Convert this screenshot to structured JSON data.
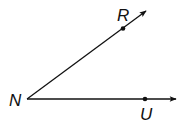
{
  "diagram": {
    "type": "angle",
    "vertex": {
      "label": "N",
      "x": 27,
      "y": 99
    },
    "rays": [
      {
        "name": "ray-NR",
        "from": "N",
        "through": "R",
        "tip": {
          "x": 147,
          "y": 10
        }
      },
      {
        "name": "ray-NU",
        "from": "N",
        "through": "U",
        "tip": {
          "x": 177,
          "y": 99
        }
      }
    ],
    "points": [
      {
        "label": "R",
        "x": 123,
        "y": 28
      },
      {
        "label": "U",
        "x": 145,
        "y": 99
      }
    ],
    "labels": {
      "N": "N",
      "R": "R",
      "U": "U"
    },
    "colors": {
      "stroke": "#111111",
      "background": "#ffffff"
    }
  }
}
